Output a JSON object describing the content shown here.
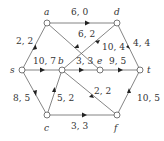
{
  "nodes": [
    {
      "id": "a",
      "label": "a",
      "x": 47,
      "y": 23
    },
    {
      "id": "d",
      "label": "d",
      "x": 117,
      "y": 23
    },
    {
      "id": "s",
      "label": "s",
      "x": 22,
      "y": 70
    },
    {
      "id": "b",
      "label": "b",
      "x": 62,
      "y": 70
    },
    {
      "id": "e",
      "label": "e",
      "x": 100,
      "y": 70
    },
    {
      "id": "t",
      "label": "t",
      "x": 140,
      "y": 70
    },
    {
      "id": "c",
      "label": "c",
      "x": 47,
      "y": 115
    },
    {
      "id": "f",
      "label": "f",
      "x": 117,
      "y": 115
    }
  ],
  "edges": [
    {
      "from": "s",
      "to": "a",
      "label": "2, 2"
    },
    {
      "from": "a",
      "to": "d",
      "label": "6, 0"
    },
    {
      "from": "a",
      "to": "e",
      "label": "6, 2"
    },
    {
      "from": "s",
      "to": "b",
      "label": "10, 7"
    },
    {
      "from": "b",
      "to": "e",
      "label": "3, 3"
    },
    {
      "from": "b",
      "to": "d",
      "label": "10, 4"
    },
    {
      "from": "d",
      "to": "t",
      "label": "4, 4"
    },
    {
      "from": "e",
      "to": "t",
      "label": "9, 5"
    },
    {
      "from": "s",
      "to": "c",
      "label": "8, 5"
    },
    {
      "from": "c",
      "to": "b",
      "label": "5, 2"
    },
    {
      "from": "b",
      "to": "f",
      "label": "2, 2"
    },
    {
      "from": "c",
      "to": "f",
      "label": "3, 3"
    },
    {
      "from": "f",
      "to": "t",
      "label": "10, 5"
    }
  ],
  "colors": {
    "line": "#555555",
    "node": "#555555",
    "text": "#333333"
  }
}
